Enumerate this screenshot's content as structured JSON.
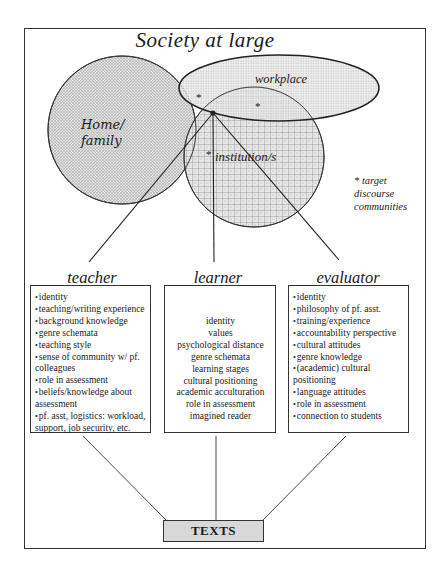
{
  "diagram": {
    "title": "Society at large",
    "communities": [
      {
        "id": "home",
        "label_line1": "Home/",
        "label_line2": "family",
        "pattern": "dots"
      },
      {
        "id": "workplace",
        "label": "workplace",
        "pattern": "fine-dots"
      },
      {
        "id": "institution",
        "label": "institution/s",
        "pattern": "grid"
      }
    ],
    "target_marker": "*",
    "note": {
      "line1": "* target",
      "line2": "discourse",
      "line3": "communities"
    },
    "roles": [
      {
        "id": "teacher",
        "label": "teacher",
        "style": "bulleted",
        "items": [
          "identity",
          "teaching/writing experience",
          "background knowledge",
          "genre schemata",
          "teaching style",
          "sense of community w/ pf. colleagues",
          "role in assessment",
          "beliefs/knowledge about assessment",
          "pf. asst, logistics: workload, support, job security, etc."
        ]
      },
      {
        "id": "learner",
        "label": "learner",
        "style": "centered",
        "items": [
          "identity",
          "values",
          "psychological distance",
          "genre schemata",
          "learning stages",
          "cultural positioning",
          "academic acculturation",
          "role in assessment",
          "imagined reader"
        ]
      },
      {
        "id": "evaluator",
        "label": "evaluator",
        "style": "bulleted",
        "items": [
          "identity",
          "philosophy of pf. asst.",
          "training/experience",
          "accountability perspective",
          "cultural attitudes",
          "genre knowledge",
          "(academic) cultural positioning",
          "language attitudes",
          "role in assessment",
          "connection to students"
        ]
      }
    ],
    "output": {
      "label": "TEXTS"
    },
    "bullet": "•"
  }
}
